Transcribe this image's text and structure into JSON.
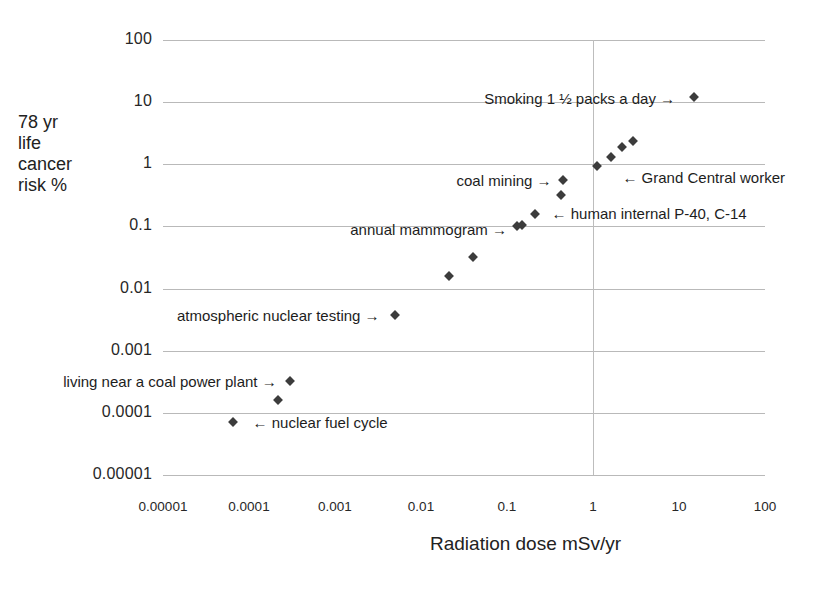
{
  "chart_data": {
    "type": "scatter",
    "title": "",
    "xlabel": "Radiation dose mSv/yr",
    "ylabel": "78 yr life cancer risk %",
    "ylabel_lines": [
      "78 yr",
      "life",
      "cancer",
      "risk %"
    ],
    "xscale": "log",
    "yscale": "log",
    "xlim": [
      1e-05,
      100
    ],
    "ylim": [
      1e-05,
      100
    ],
    "grid": true,
    "legend": "none",
    "xticks": [
      "0.00001",
      "0.0001",
      "0.001",
      "0.01",
      "0.1",
      "1",
      "10",
      "100"
    ],
    "xtick_values": [
      1e-05,
      0.0001,
      0.001,
      0.01,
      0.1,
      1,
      10,
      100
    ],
    "yticks": [
      "100",
      "10",
      "1",
      "0.1",
      "0.01",
      "0.001",
      "0.0001",
      "0.00001"
    ],
    "ytick_values": [
      100,
      10,
      1,
      0.1,
      0.01,
      0.001,
      0.0001,
      1e-05
    ],
    "points": [
      {
        "x": 6.5e-05,
        "y": 7e-05,
        "label": "nuclear fuel cycle"
      },
      {
        "x": 0.00022,
        "y": 0.00016,
        "label": ""
      },
      {
        "x": 0.0003,
        "y": 0.00032,
        "label": "living near a coal power plant"
      },
      {
        "x": 0.005,
        "y": 0.0037,
        "label": "atmospheric nuclear testing"
      },
      {
        "x": 0.021,
        "y": 0.016,
        "label": ""
      },
      {
        "x": 0.04,
        "y": 0.032,
        "label": ""
      },
      {
        "x": 0.13,
        "y": 0.1,
        "label": "annual mammogram"
      },
      {
        "x": 0.15,
        "y": 0.105,
        "label": ""
      },
      {
        "x": 0.21,
        "y": 0.16,
        "label": "human internal P-40, C-14"
      },
      {
        "x": 0.42,
        "y": 0.32,
        "label": ""
      },
      {
        "x": 0.45,
        "y": 0.55,
        "label": "coal mining"
      },
      {
        "x": 1.1,
        "y": 0.95,
        "label": "Grand Central worker"
      },
      {
        "x": 1.6,
        "y": 1.3,
        "label": ""
      },
      {
        "x": 2.2,
        "y": 1.9,
        "label": ""
      },
      {
        "x": 2.9,
        "y": 2.4,
        "label": ""
      },
      {
        "x": 15.0,
        "y": 12.0,
        "label": "Smoking 1 ½ packs a day"
      }
    ],
    "annotations": [
      {
        "text": "Smoking 1 ½ packs a day →",
        "x": 9.0,
        "y": 11.5,
        "anchor": "right"
      },
      {
        "text": "← Grand Central worker",
        "x": 2.2,
        "y": 0.62,
        "anchor": "left"
      },
      {
        "text": "coal mining →",
        "x": 0.33,
        "y": 0.55,
        "anchor": "right"
      },
      {
        "text": "← human internal P-40, C-14",
        "x": 0.33,
        "y": 0.165,
        "anchor": "left"
      },
      {
        "text": "annual mammogram →",
        "x": 0.1,
        "y": 0.092,
        "anchor": "right"
      },
      {
        "text": "atmospheric nuclear testing →",
        "x": 0.0033,
        "y": 0.0038,
        "anchor": "right"
      },
      {
        "text": "living near a coal power plant →",
        "x": 0.00021,
        "y": 0.00033,
        "anchor": "right"
      },
      {
        "text": "← nuclear fuel cycle",
        "x": 0.00011,
        "y": 7e-05,
        "anchor": "left"
      }
    ],
    "marker": {
      "shape": "diamond",
      "color": "#3c3c3c",
      "size": 7
    },
    "grid_color": "#b9b9b9",
    "background": "#ffffff"
  }
}
